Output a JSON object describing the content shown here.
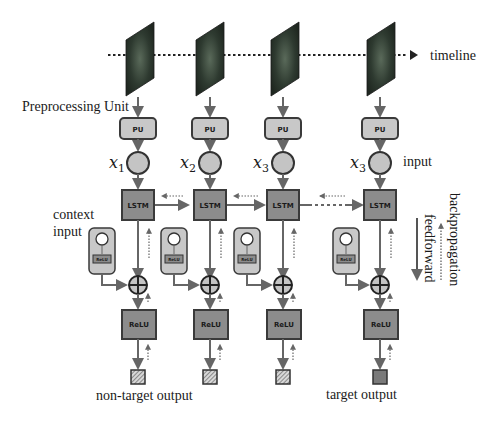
{
  "labels": {
    "timeline": "timeline",
    "preprocessing_unit": "Preprocessing Unit",
    "input": "input",
    "context_input_line1": "context",
    "context_input_line2": "input",
    "non_target_output": "non-target output",
    "target_output": "target output",
    "backpropagation": "backpropagation",
    "feedforward": "feedforward"
  },
  "columns": [
    {
      "pu": "PU",
      "input_var": "x",
      "input_sub": "1",
      "lstm": "LSTM",
      "context_relu": "ReLU",
      "relu": "ReLU",
      "output_type": "non-target"
    },
    {
      "pu": "PU",
      "input_var": "x",
      "input_sub": "2",
      "lstm": "LSTM",
      "context_relu": "ReLU",
      "relu": "ReLU",
      "output_type": "non-target"
    },
    {
      "pu": "PU",
      "input_var": "x",
      "input_sub": "3",
      "lstm": "LSTM",
      "context_relu": "ReLU",
      "relu": "ReLU",
      "output_type": "non-target"
    },
    {
      "pu": "PU",
      "input_var": "x",
      "input_sub": "3",
      "lstm": "LSTM",
      "context_relu": "ReLU",
      "relu": "ReLU",
      "output_type": "target"
    }
  ],
  "colors": {
    "box_fill": "#8c8c8c",
    "pu_fill": "#c8c8c8",
    "circle_fill": "#c4c4c4",
    "context_fill": "#c8c8c8",
    "stroke": "#3a3a3a",
    "arrow": "#666666",
    "target_fill": "#7a7a7a"
  }
}
